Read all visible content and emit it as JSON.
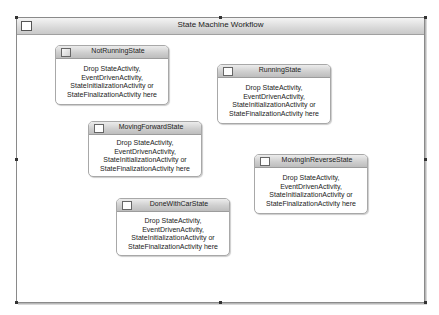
{
  "workflow": {
    "title": "State Machine Workflow",
    "icon": "workflow-icon"
  },
  "drop_hint": [
    "Drop StateActivity,",
    "EventDrivenActivity,",
    "StateInitializationActivity or",
    "StateFinalizationActivity here"
  ],
  "states": [
    {
      "name": "NotRunningState",
      "icon": "initial-state-icon",
      "body": [
        "Drop StateActivity,",
        "EventDrivenActivity,",
        "StateInitializationActivity or",
        "StateFinalizationActivity here"
      ]
    },
    {
      "name": "RunningState",
      "icon": "state-icon",
      "body": [
        "Drop StateActivity,",
        "EventDrivenActivity,",
        "StateInitializationActivity or",
        "StateFinalizationActivity here"
      ]
    },
    {
      "name": "MovingForwardState",
      "icon": "state-icon",
      "body": [
        "Drop StateActivity,",
        "EventDrivenActivity,",
        "StateInitializationActivity or",
        "StateFinalizationActivity here"
      ]
    },
    {
      "name": "MovingInReverseState",
      "icon": "state-icon",
      "body": [
        "Drop StateActivity,",
        "EventDrivenActivity,",
        "StateInitializationActivity or",
        "StateFinalizationActivity here"
      ]
    },
    {
      "name": "DoneWithCarState",
      "icon": "state-icon",
      "body": [
        "Drop StateActivity,",
        "EventDrivenActivity,",
        "StateInitializationActivity or",
        "StateFinalizationActivity here"
      ]
    }
  ]
}
